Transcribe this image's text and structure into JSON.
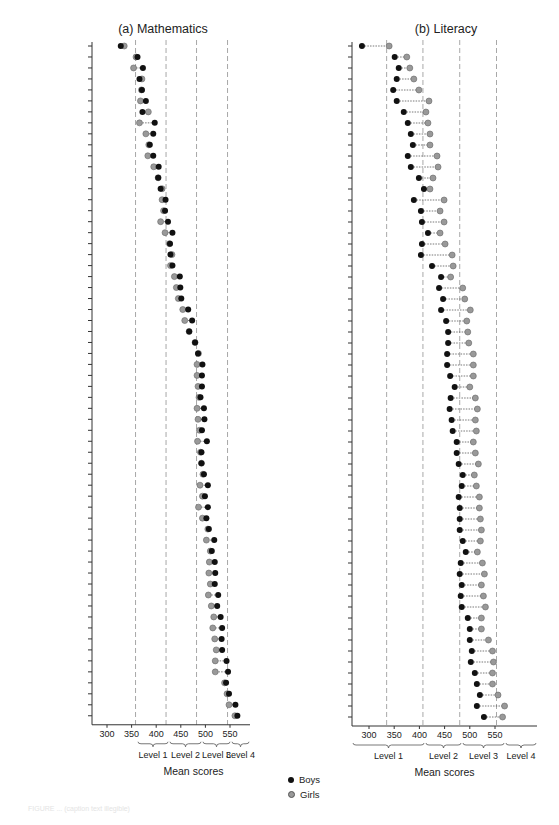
{
  "legend": {
    "boys_label": "Boys",
    "girls_label": "Girls",
    "boys_color": "#111111",
    "girls_color": "#999999"
  },
  "caption": "FIGURE ... (caption text illegible)",
  "chart_data": [
    {
      "type": "scatter",
      "subtype": "dumbbell",
      "title": "(a) Mathematics",
      "xlabel": "Mean scores",
      "ylabel": "",
      "xlim": [
        272,
        588
      ],
      "xticks": [
        300,
        350,
        400,
        450,
        500,
        550
      ],
      "level_boundaries": [
        358,
        420,
        482,
        545
      ],
      "level_labels": [
        "Level 1",
        "Level 2",
        "Level 3",
        "Level 4"
      ],
      "categories": [
        "Kyrgyz Republic",
        "Panama",
        "Peru",
        "Qatar",
        "Indonesia",
        "Tunisia",
        "Albania",
        "Colombia",
        "Brazil",
        "Jordan",
        "Argentina",
        "Montenegro",
        "Kazakhstan",
        "Trinidad",
        "Mexico",
        "Thailand",
        "Chile",
        "Uruguay",
        "Romania",
        "Bulgaria",
        "Azerbaijan",
        "Serbia",
        "Turkey",
        "Israel",
        "Croatia",
        "Greece",
        "Russian Federation",
        "Lithuania",
        "Latvia",
        "Italy",
        "Spain",
        "Portugal",
        "Ireland",
        "United States",
        "Luxembourg",
        "Hungary",
        "United Kingdom",
        "Czech Republic",
        "Sweden",
        "Poland",
        "Austria",
        "Slovak Republic",
        "France",
        "Norway",
        "Slovenia",
        "Denmark",
        "Iceland",
        "Estonia",
        "Germany",
        "Australia",
        "Belgium",
        "New Zealand",
        "Macao SAR, China",
        "Netherlands",
        "Canada",
        "Japan",
        "Switzerland",
        "Liechtenstein",
        "Finland",
        "Korea, Republic",
        "Hong Kong SAR, China",
        "Singapore"
      ],
      "series": [
        {
          "name": "Boys",
          "values": [
            328,
            362,
            373,
            366,
            371,
            379,
            372,
            397,
            394,
            387,
            394,
            405,
            404,
            409,
            419,
            418,
            424,
            433,
            428,
            429,
            433,
            448,
            449,
            451,
            465,
            473,
            467,
            479,
            485,
            494,
            493,
            493,
            490,
            497,
            498,
            493,
            503,
            492,
            492,
            497,
            505,
            499,
            505,
            502,
            507,
            518,
            513,
            519,
            520,
            519,
            526,
            524,
            531,
            534,
            533,
            534,
            543,
            546,
            542,
            548,
            561,
            565
          ]
        },
        {
          "name": "Girls",
          "values": [
            335,
            359,
            354,
            371,
            370,
            368,
            384,
            366,
            379,
            385,
            383,
            395,
            404,
            412,
            412,
            415,
            409,
            418,
            427,
            432,
            429,
            437,
            441,
            445,
            454,
            458,
            467,
            479,
            486,
            483,
            483,
            485,
            487,
            483,
            485,
            488,
            484,
            490,
            492,
            495,
            489,
            494,
            486,
            494,
            505,
            502,
            510,
            508,
            507,
            510,
            506,
            512,
            517,
            515,
            519,
            522,
            520,
            520,
            539,
            544,
            548,
            560
          ]
        }
      ],
      "grid": false,
      "legend_position": "bottom-center"
    },
    {
      "type": "scatter",
      "subtype": "dumbbell",
      "title": "(b) Literacy",
      "xlabel": "Mean scores",
      "ylabel": "",
      "xlim": [
        272,
        610
      ],
      "xticks": [
        300,
        350,
        400,
        450,
        500,
        550
      ],
      "level_boundaries": [
        335,
        407,
        480,
        553
      ],
      "level_labels": [
        "Level 1",
        "Level 2",
        "Level 3",
        "Level 4"
      ],
      "categories": [
        "Kyrgyz Republic",
        "Azerbaijan",
        "Peru",
        "Panama",
        "Qatar",
        "Albania",
        "Kazakhstan",
        "Argentina",
        "Indonesia",
        "Tunisia",
        "Jordan",
        "Montenegro",
        "Brazil",
        "Colombia",
        "Trinidad",
        "Thailand",
        "Romania",
        "Mexico",
        "Uruguay",
        "Bulgaria",
        "Serbia",
        "Chile",
        "Russian Federation",
        "Turkey",
        "Lithuania",
        "Austria",
        "Luxembourg",
        "Israel",
        "Croatia",
        "Slovak Republic",
        "Czech Republic",
        "Spain",
        "Greece",
        "Slovenia",
        "Latvia",
        "Italy",
        "Macao SAR, China",
        "Portugal",
        "Hungary",
        "United Kingdom",
        "Denmark",
        "France",
        "Ireland",
        "Germany",
        "Sweden",
        "Liechtenstein",
        "United States",
        "Iceland",
        "Poland",
        "Switzerland",
        "Estonia",
        "Norway",
        "Belgium",
        "Netherlands",
        "Australia",
        "Japan",
        "New Zealand",
        "Canada",
        "Singapore",
        "Hong Kong SAR, China",
        "Finland",
        "Korea, Republic"
      ],
      "series": [
        {
          "name": "Boys",
          "values": [
            286,
            351,
            359,
            355,
            348,
            355,
            369,
            377,
            383,
            387,
            377,
            383,
            399,
            409,
            389,
            403,
            405,
            417,
            405,
            403,
            425,
            443,
            439,
            447,
            443,
            453,
            457,
            457,
            455,
            455,
            461,
            470,
            462,
            460,
            464,
            466,
            474,
            474,
            478,
            486,
            484,
            478,
            480,
            480,
            480,
            486,
            492,
            482,
            480,
            484,
            482,
            484,
            496,
            500,
            500,
            504,
            502,
            510,
            514,
            520,
            514,
            528
          ]
        },
        {
          "name": "Girls",
          "values": [
            340,
            375,
            381,
            389,
            399,
            419,
            413,
            417,
            421,
            421,
            435,
            437,
            427,
            421,
            449,
            441,
            449,
            441,
            451,
            465,
            467,
            462,
            486,
            490,
            501,
            494,
            496,
            498,
            507,
            507,
            507,
            500,
            511,
            515,
            511,
            513,
            507,
            511,
            517,
            509,
            513,
            519,
            519,
            521,
            523,
            521,
            515,
            525,
            529,
            523,
            527,
            531,
            523,
            523,
            537,
            545,
            547,
            545,
            545,
            556,
            569,
            565
          ]
        }
      ],
      "grid": false,
      "legend_position": "bottom-center"
    }
  ]
}
